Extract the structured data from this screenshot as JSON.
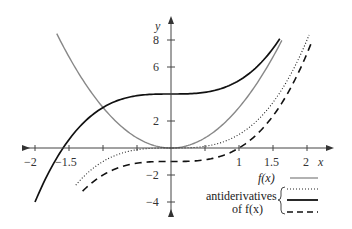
{
  "chart_data": {
    "type": "line",
    "title": "",
    "xlabel": "x",
    "ylabel": "y",
    "xlim": [
      -2.1,
      2.3
    ],
    "ylim": [
      -4.6,
      9
    ],
    "x_ticks": [
      -2,
      -1.5,
      -1,
      -0.5,
      0.5,
      1,
      1.5,
      2
    ],
    "x_tick_labels": [
      "-2",
      "-1.5",
      "",
      "",
      "",
      "1",
      "1.5",
      "2"
    ],
    "y_ticks": [
      -4,
      -2,
      2,
      6,
      8
    ],
    "y_tick_labels": [
      "-4",
      "-2",
      "2",
      "6",
      "8"
    ],
    "grid": false,
    "series": [
      {
        "name": "f(x)",
        "formula": "3x^2",
        "style": "solid",
        "color": "#888888",
        "x_range": [
          -1.68,
          1.63
        ]
      },
      {
        "name": "antiderivative C=0",
        "formula": "x^3",
        "style": "dotted",
        "color": "#222222",
        "x_range": [
          -1.4,
          2.03
        ]
      },
      {
        "name": "antiderivative C=4",
        "formula": "x^3+4",
        "style": "solid",
        "color": "#111111",
        "x_range": [
          -2.0,
          1.6
        ]
      },
      {
        "name": "antiderivative C=-1",
        "formula": "x^3-1",
        "style": "dashed",
        "color": "#111111",
        "x_range": [
          -1.3,
          2.08
        ]
      }
    ],
    "legend": {
      "position": "lower right",
      "entries": [
        {
          "label": "f(x)",
          "style": "solid-gray"
        },
        {
          "group_label": [
            "antiderivatives",
            "of f(x)"
          ],
          "styles": [
            "dotted",
            "solid",
            "dashed"
          ]
        }
      ]
    }
  },
  "axes": {
    "x_label": "x",
    "y_label": "y",
    "x_tick_labels": [
      "−2",
      "−1.5",
      "1",
      "1.5",
      "2"
    ],
    "y_tick_labels": [
      "8",
      "6",
      "2",
      "−2",
      "−4"
    ]
  },
  "legend": {
    "fx_label": "f(x)",
    "anti_label_1": "antiderivatives",
    "anti_label_2": "of f(x)"
  }
}
